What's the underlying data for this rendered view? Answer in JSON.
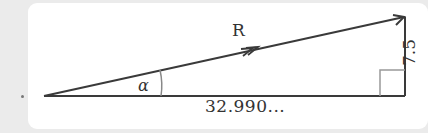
{
  "diagram": {
    "type": "right-triangle-vector",
    "vector_label": "R",
    "angle_label": "α",
    "base_label": "32.990...",
    "height_label": "7.5",
    "colors": {
      "background": "#ebebeb",
      "card": "#ffffff",
      "line": "#3a3a3a",
      "arc": "#888888",
      "right_angle_marker": "#999999",
      "text": "#333333"
    }
  }
}
